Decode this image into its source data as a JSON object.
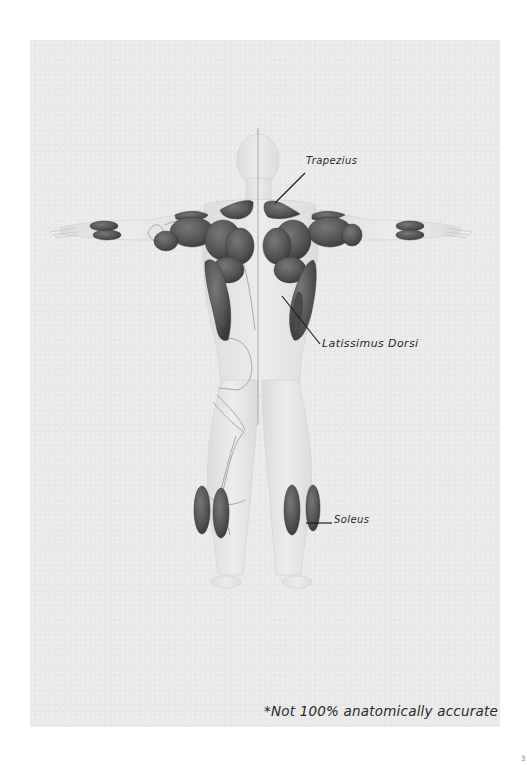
{
  "figure": {
    "labels": {
      "trapezius": "Trapezius",
      "latissimus_dorsi": "Latissimus Dorsi",
      "soleus": "Soleus"
    },
    "disclaimer": "*Not 100% anatomically accurate",
    "page_mark": "3"
  },
  "colors": {
    "paper": "#e9e9e9",
    "body": "#e4e4e4",
    "muscle": "#5a5a5a",
    "muscle_dark": "#3e3e3e",
    "outline": "#9a9a9a",
    "leader_line": "#1e1e1e",
    "text": "#2a2a2a"
  },
  "icons": {
    "leader": "leader-line-icon"
  }
}
